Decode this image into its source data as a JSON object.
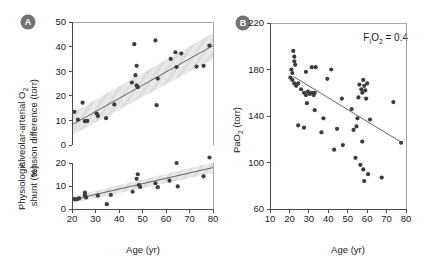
{
  "figure": {
    "background": "#ffffff",
    "point_color": "#3d3d3d",
    "line_color": "#555555",
    "band_color": "#dcdcdc",
    "axis_color": "#4a4a4a",
    "badge_color": "#737373"
  },
  "panels": [
    {
      "id": "A",
      "badge_label": "A",
      "xlabel": "Age (yr)",
      "subplots": [
        {
          "id": "A-top",
          "ylabel_line1": "Alveolar-arterial O",
          "ylabel_sub1": "2",
          "ylabel_line2": "tension difference (torr)",
          "ylabel_full": "Alveolar-arterial O2 tension difference (torr)",
          "yticks": [
            0,
            10,
            20,
            30,
            40,
            50
          ],
          "ylim": [
            0,
            50
          ],
          "xlim": [
            20,
            80
          ],
          "xticks": [
            20,
            30,
            40,
            50,
            60,
            70,
            80
          ],
          "fit": {
            "x1": 20,
            "y1": 8.2,
            "x2": 80,
            "y2": 40.4
          },
          "band": {
            "x1": 20,
            "lo1": 4.0,
            "hi1": 13.0,
            "x2": 80,
            "lo2": 35.0,
            "hi2": 45.5
          },
          "points": [
            {
              "x": 21.0,
              "y": 13.5
            },
            {
              "x": 22.5,
              "y": 10.3
            },
            {
              "x": 24.5,
              "y": 17.2
            },
            {
              "x": 25.5,
              "y": 9.7
            },
            {
              "x": 26.5,
              "y": 9.8
            },
            {
              "x": 30.5,
              "y": 12.8
            },
            {
              "x": 31.0,
              "y": 11.8
            },
            {
              "x": 34.5,
              "y": 10.9
            },
            {
              "x": 38.0,
              "y": 16.5
            },
            {
              "x": 45.5,
              "y": 25.4
            },
            {
              "x": 46.5,
              "y": 41.0
            },
            {
              "x": 47.0,
              "y": 28.4
            },
            {
              "x": 47.5,
              "y": 32.2
            },
            {
              "x": 47.5,
              "y": 24.2
            },
            {
              "x": 48.0,
              "y": 23.5
            },
            {
              "x": 55.5,
              "y": 42.5
            },
            {
              "x": 56.0,
              "y": 16.2
            },
            {
              "x": 56.5,
              "y": 27.0
            },
            {
              "x": 62.0,
              "y": 35.0
            },
            {
              "x": 64.0,
              "y": 37.7
            },
            {
              "x": 64.5,
              "y": 31.7
            },
            {
              "x": 66.5,
              "y": 37.2
            },
            {
              "x": 73.0,
              "y": 31.9
            },
            {
              "x": 76.0,
              "y": 32.2
            },
            {
              "x": 78.5,
              "y": 40.4
            }
          ]
        },
        {
          "id": "A-bottom",
          "ylabel_line1": "Physiologic",
          "ylabel_line2": "shunt (%)",
          "ylabel_full": "Physiologic shunt (%)",
          "yticks": [
            0,
            10,
            20
          ],
          "ylim": [
            0,
            20
          ],
          "xlim": [
            20,
            80
          ],
          "xticks": [
            20,
            30,
            40,
            50,
            60,
            70,
            80
          ],
          "fit": {
            "x1": 20,
            "y1": 4.0,
            "x2": 80,
            "y2": 18.0
          },
          "band": {
            "x1": 20,
            "lo1": 2.6,
            "hi1": 5.4,
            "x2": 80,
            "lo2": 15.5,
            "hi2": 20.2
          },
          "points": [
            {
              "x": 21.0,
              "y": 4.3
            },
            {
              "x": 22.0,
              "y": 4.2
            },
            {
              "x": 23.0,
              "y": 4.6
            },
            {
              "x": 25.5,
              "y": 6.0
            },
            {
              "x": 25.5,
              "y": 7.1
            },
            {
              "x": 26.0,
              "y": 5.0
            },
            {
              "x": 31.0,
              "y": 5.8
            },
            {
              "x": 34.8,
              "y": 2.1
            },
            {
              "x": 36.5,
              "y": 6.1
            },
            {
              "x": 45.8,
              "y": 7.5
            },
            {
              "x": 47.5,
              "y": 13.1
            },
            {
              "x": 48.0,
              "y": 15.1
            },
            {
              "x": 48.5,
              "y": 10.4
            },
            {
              "x": 49.0,
              "y": 9.6
            },
            {
              "x": 55.5,
              "y": 11.2
            },
            {
              "x": 56.5,
              "y": 9.5
            },
            {
              "x": 61.5,
              "y": 12.3
            },
            {
              "x": 64.5,
              "y": 20.0
            },
            {
              "x": 65.0,
              "y": 9.8
            },
            {
              "x": 76.0,
              "y": 14.2
            },
            {
              "x": 78.5,
              "y": 22.4
            }
          ]
        }
      ]
    },
    {
      "id": "B",
      "badge_label": "B",
      "xlabel": "Age (yr)",
      "ylabel_line1": "PaO",
      "ylabel_sub1": "2",
      "ylabel_line2": " (torr)",
      "ylabel_full": "PaO2 (torr)",
      "annotation": "F1O2 = 0.4",
      "annotation_parts": {
        "pre": "F",
        "sub1": "I",
        "mid": "O",
        "sub2": "2",
        "post": " = 0.4"
      },
      "yticks": [
        60,
        100,
        140,
        180,
        220
      ],
      "ylim": [
        60,
        220
      ],
      "xlim": [
        10,
        80
      ],
      "xticks": [
        10,
        20,
        30,
        40,
        50,
        60,
        70,
        80
      ],
      "fit": {
        "x1": 22,
        "y1": 174,
        "x2": 78,
        "y2": 117
      },
      "points": [
        {
          "x": 22.0,
          "y": 196
        },
        {
          "x": 22.5,
          "y": 191
        },
        {
          "x": 22.5,
          "y": 187
        },
        {
          "x": 23.0,
          "y": 184
        },
        {
          "x": 21.0,
          "y": 180
        },
        {
          "x": 21.5,
          "y": 177
        },
        {
          "x": 20.5,
          "y": 173
        },
        {
          "x": 21.5,
          "y": 171
        },
        {
          "x": 22.5,
          "y": 168
        },
        {
          "x": 23.5,
          "y": 166
        },
        {
          "x": 24.5,
          "y": 168
        },
        {
          "x": 26.0,
          "y": 163
        },
        {
          "x": 27.5,
          "y": 160
        },
        {
          "x": 28.5,
          "y": 158
        },
        {
          "x": 29.5,
          "y": 161
        },
        {
          "x": 30.5,
          "y": 159
        },
        {
          "x": 31.5,
          "y": 160
        },
        {
          "x": 32.5,
          "y": 158
        },
        {
          "x": 33.0,
          "y": 160
        },
        {
          "x": 29.0,
          "y": 151
        },
        {
          "x": 31.5,
          "y": 182
        },
        {
          "x": 33.5,
          "y": 182
        },
        {
          "x": 28.5,
          "y": 178
        },
        {
          "x": 41.5,
          "y": 180
        },
        {
          "x": 39.5,
          "y": 172
        },
        {
          "x": 24.5,
          "y": 132
        },
        {
          "x": 27.5,
          "y": 130
        },
        {
          "x": 36.5,
          "y": 126
        },
        {
          "x": 37.5,
          "y": 138
        },
        {
          "x": 33.0,
          "y": 145
        },
        {
          "x": 43.0,
          "y": 111
        },
        {
          "x": 44.5,
          "y": 129
        },
        {
          "x": 47.5,
          "y": 115
        },
        {
          "x": 47.0,
          "y": 155
        },
        {
          "x": 52.0,
          "y": 146
        },
        {
          "x": 53.0,
          "y": 128
        },
        {
          "x": 54.0,
          "y": 104
        },
        {
          "x": 54.5,
          "y": 131
        },
        {
          "x": 55.5,
          "y": 156
        },
        {
          "x": 56.0,
          "y": 167
        },
        {
          "x": 57.0,
          "y": 163
        },
        {
          "x": 57.5,
          "y": 160
        },
        {
          "x": 58.0,
          "y": 171
        },
        {
          "x": 58.5,
          "y": 166
        },
        {
          "x": 59.0,
          "y": 162
        },
        {
          "x": 59.5,
          "y": 155
        },
        {
          "x": 60.0,
          "y": 168
        },
        {
          "x": 55.0,
          "y": 138
        },
        {
          "x": 57.5,
          "y": 118
        },
        {
          "x": 56.5,
          "y": 98
        },
        {
          "x": 58.0,
          "y": 94
        },
        {
          "x": 58.5,
          "y": 84
        },
        {
          "x": 60.5,
          "y": 90
        },
        {
          "x": 61.5,
          "y": 137
        },
        {
          "x": 67.5,
          "y": 87
        },
        {
          "x": 73.5,
          "y": 152
        },
        {
          "x": 77.5,
          "y": 117
        }
      ]
    }
  ]
}
